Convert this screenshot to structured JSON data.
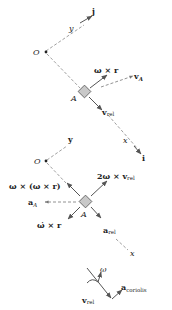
{
  "diagram": {
    "colors": {
      "line": "#555555",
      "dashed": "#888888",
      "block_fill": "#c8c8c8",
      "text": "#222222"
    },
    "velocity_panel": {
      "origin_label": "O",
      "point_label": "A",
      "axis_y_label": "y",
      "axis_x_label": "x",
      "unit_j": "j",
      "unit_i": "i",
      "vectors": {
        "omega_cross_r": "ω × r",
        "v_A": "v",
        "v_A_sub": "A",
        "v_rel": "v",
        "v_rel_sub": "rel"
      }
    },
    "acceleration_panel": {
      "origin_label": "O",
      "point_label": "A",
      "axis_y_label": "y",
      "axis_x_label": "x",
      "vectors": {
        "centripetal": "ω × (ω × r)",
        "coriolis_term": "2ω × v",
        "coriolis_term_sub": "rel",
        "a_A": "a",
        "a_A_sub": "A",
        "angular_accel_term": "ω̇ × r",
        "a_rel": "a",
        "a_rel_sub": "rel"
      }
    },
    "coriolis_detail": {
      "omega_label": "ω",
      "v_rel": "v",
      "v_rel_sub": "rel",
      "a_coriolis": "a",
      "a_coriolis_sub": "coriolis"
    }
  }
}
